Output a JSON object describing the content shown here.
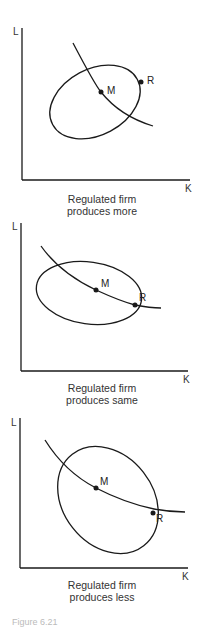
{
  "figure": {
    "caption_partial": "Figure 6.21",
    "panels": [
      {
        "y_axis_label": "L",
        "x_axis_label": "K",
        "points": [
          {
            "label": "M"
          },
          {
            "label": "R"
          }
        ],
        "caption_line1": "Regulated firm",
        "caption_line2": "produces more"
      },
      {
        "y_axis_label": "L",
        "x_axis_label": "K",
        "points": [
          {
            "label": "M"
          },
          {
            "label": "R"
          }
        ],
        "caption_line1": "Regulated firm",
        "caption_line2": "produces same"
      },
      {
        "y_axis_label": "L",
        "x_axis_label": "K",
        "points": [
          {
            "label": "M"
          },
          {
            "label": "R"
          }
        ],
        "caption_line1": "Regulated firm",
        "caption_line2": "produces less"
      }
    ],
    "colors": {
      "line": "#1a1a1a",
      "text": "#333333"
    }
  }
}
